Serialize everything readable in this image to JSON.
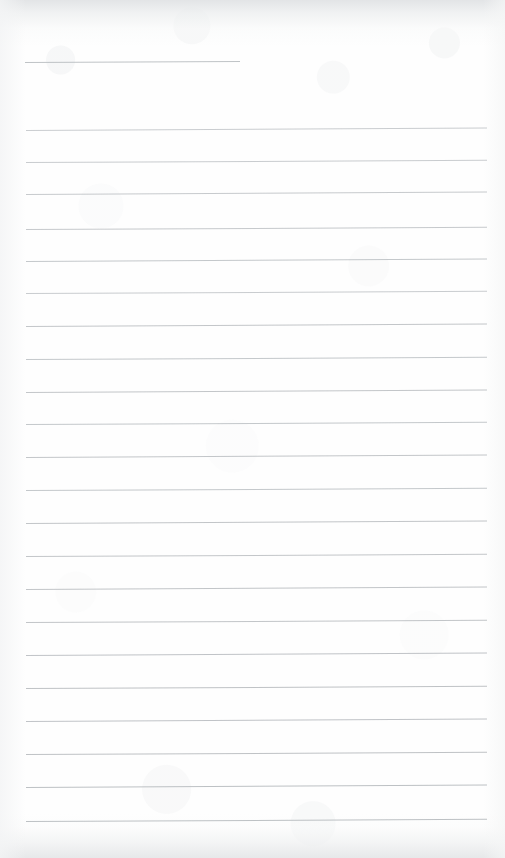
{
  "document": {
    "kind": "scanned-blank-lined-paper",
    "page_width": 505,
    "page_height": 858,
    "background_color": "#fefefe",
    "rule_color": "#b4b8bc",
    "text_content": "",
    "visible_text_lines": [],
    "short_rule": {
      "index": 0,
      "x_start": 25,
      "x_end": 240,
      "y": 62,
      "thickness": 1,
      "tilt_deg": -0.25,
      "opacity": 0.85
    },
    "rules": [
      {
        "index": 1,
        "y": 130,
        "x_start": 26,
        "x_end": 487,
        "tilt_deg": -0.3,
        "opacity": 0.7
      },
      {
        "index": 2,
        "y": 162,
        "x_start": 26,
        "x_end": 487,
        "tilt_deg": -0.28,
        "opacity": 0.72
      },
      {
        "index": 3,
        "y": 194,
        "x_start": 26,
        "x_end": 487,
        "tilt_deg": -0.3,
        "opacity": 0.74
      },
      {
        "index": 4,
        "y": 229,
        "x_start": 26,
        "x_end": 487,
        "tilt_deg": -0.28,
        "opacity": 0.76
      },
      {
        "index": 5,
        "y": 261,
        "x_start": 26,
        "x_end": 487,
        "tilt_deg": -0.3,
        "opacity": 0.78
      },
      {
        "index": 6,
        "y": 293,
        "x_start": 26,
        "x_end": 487,
        "tilt_deg": -0.28,
        "opacity": 0.72
      },
      {
        "index": 7,
        "y": 326,
        "x_start": 26,
        "x_end": 487,
        "tilt_deg": -0.3,
        "opacity": 0.8
      },
      {
        "index": 8,
        "y": 359,
        "x_start": 26,
        "x_end": 487,
        "tilt_deg": -0.28,
        "opacity": 0.78
      },
      {
        "index": 9,
        "y": 392,
        "x_start": 26,
        "x_end": 487,
        "tilt_deg": -0.3,
        "opacity": 0.8
      },
      {
        "index": 10,
        "y": 424,
        "x_start": 26,
        "x_end": 487,
        "tilt_deg": -0.28,
        "opacity": 0.78
      },
      {
        "index": 11,
        "y": 457,
        "x_start": 26,
        "x_end": 487,
        "tilt_deg": -0.3,
        "opacity": 0.8
      },
      {
        "index": 12,
        "y": 490,
        "x_start": 26,
        "x_end": 487,
        "tilt_deg": -0.28,
        "opacity": 0.78
      },
      {
        "index": 13,
        "y": 523,
        "x_start": 26,
        "x_end": 487,
        "tilt_deg": -0.3,
        "opacity": 0.82
      },
      {
        "index": 14,
        "y": 556,
        "x_start": 26,
        "x_end": 487,
        "tilt_deg": -0.28,
        "opacity": 0.8
      },
      {
        "index": 15,
        "y": 589,
        "x_start": 26,
        "x_end": 487,
        "tilt_deg": -0.3,
        "opacity": 0.82
      },
      {
        "index": 16,
        "y": 622,
        "x_start": 26,
        "x_end": 487,
        "tilt_deg": -0.28,
        "opacity": 0.82
      },
      {
        "index": 17,
        "y": 655,
        "x_start": 26,
        "x_end": 487,
        "tilt_deg": -0.3,
        "opacity": 0.84
      },
      {
        "index": 18,
        "y": 688,
        "x_start": 26,
        "x_end": 487,
        "tilt_deg": -0.28,
        "opacity": 0.86
      },
      {
        "index": 19,
        "y": 721,
        "x_start": 26,
        "x_end": 487,
        "tilt_deg": -0.3,
        "opacity": 0.84
      },
      {
        "index": 20,
        "y": 754,
        "x_start": 26,
        "x_end": 487,
        "tilt_deg": -0.28,
        "opacity": 0.86
      },
      {
        "index": 21,
        "y": 787,
        "x_start": 26,
        "x_end": 487,
        "tilt_deg": -0.3,
        "opacity": 0.88
      },
      {
        "index": 22,
        "y": 821,
        "x_start": 26,
        "x_end": 487,
        "tilt_deg": -0.28,
        "opacity": 0.88
      }
    ]
  }
}
